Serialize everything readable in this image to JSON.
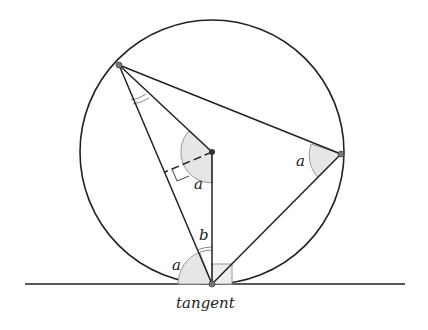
{
  "diagram": {
    "labels": {
      "a_left": "a",
      "a_center": "a",
      "a_right": "a",
      "b": "b",
      "tangent": "tangent"
    },
    "points": {
      "top_left": [
        119,
        65
      ],
      "center": [
        212,
        152
      ],
      "right": [
        341,
        154
      ],
      "tangent_point": [
        212,
        284
      ]
    },
    "circle": {
      "cx": 212,
      "cy": 152,
      "r": 132
    },
    "colors": {
      "line": "#222222",
      "fill": "#e8e8e8",
      "point": "#888888"
    }
  }
}
